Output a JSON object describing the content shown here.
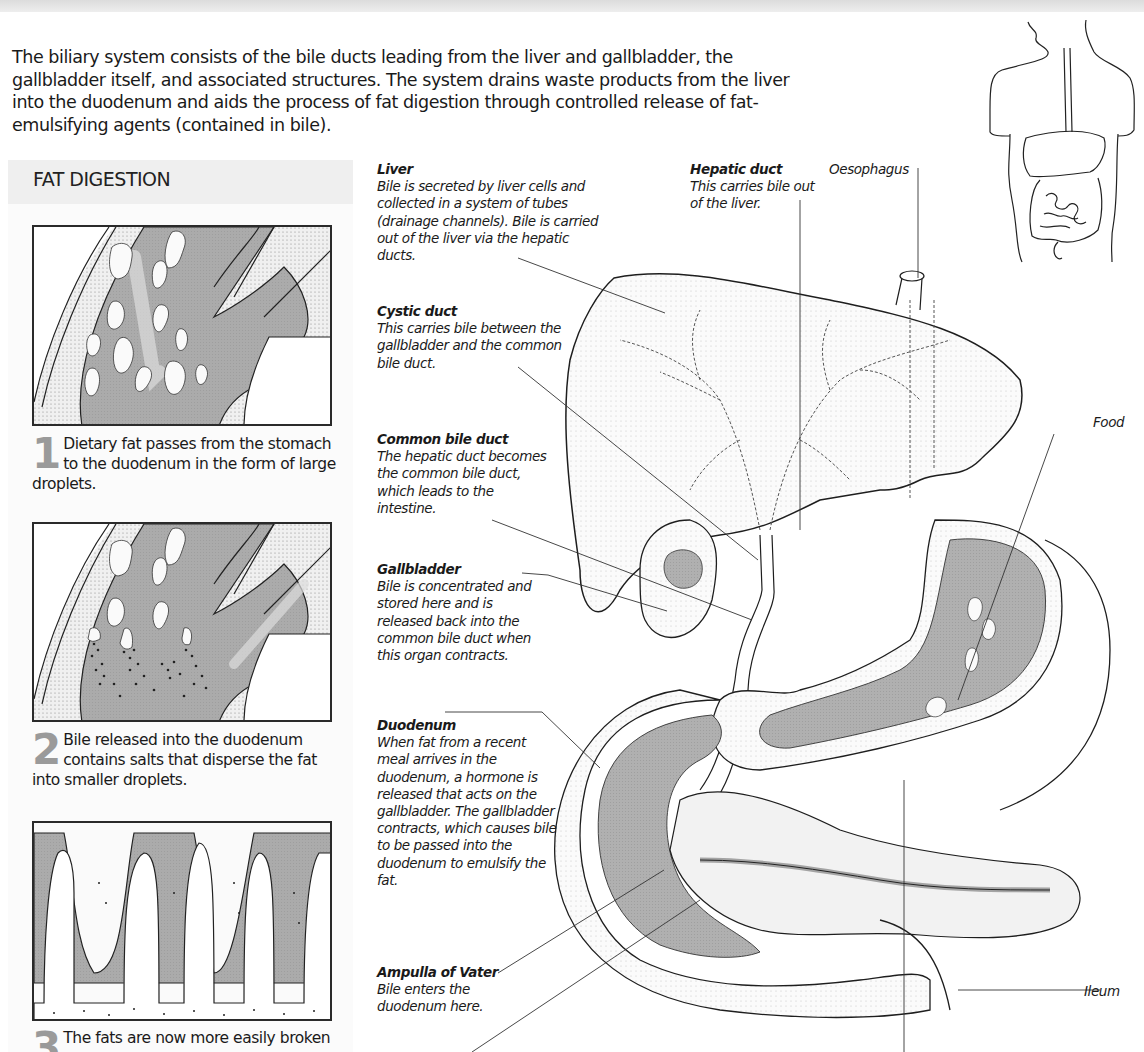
{
  "intro": {
    "text": "The biliary system consists of the bile ducts leading from the liver and gallbladder, the gallbladder itself, and associated structures. The system drains waste products from the liver into the duodenum and aids the process of fat digestion through controlled release of fat-emulsifying agents (contained in bile)."
  },
  "sidebar": {
    "title": "FAT DIGESTION",
    "steps": [
      {
        "number": "1",
        "text": "Dietary fat passes from the stomach to the duodenum in the form of large droplets."
      },
      {
        "number": "2",
        "text": "Bile released into the duodenum contains salts that disperse the fat into smaller droplets."
      },
      {
        "number": "3",
        "text": "The fats are now more easily broken"
      }
    ]
  },
  "labels": {
    "liver": {
      "title": "Liver",
      "desc": "Bile is secreted by liver cells and collected in a system of tubes (drainage channels). Bile is carried out of the liver via the hepatic ducts."
    },
    "cystic_duct": {
      "title": "Cystic duct",
      "desc": "This carries bile between the gallbladder and the common bile duct."
    },
    "common_bile_duct": {
      "title": "Common bile duct",
      "desc": "The hepatic duct becomes the common bile duct, which leads to the intestine."
    },
    "gallbladder": {
      "title": "Gallbladder",
      "desc": "Bile is concentrated and stored here and is released back into the common bile duct when this organ contracts."
    },
    "duodenum": {
      "title": "Duodenum",
      "desc": "When fat from a recent meal arrives in the duodenum, a hormone is released that acts on the gallbladder. The gallbladder contracts, which causes bile to be passed into the duodenum to emulsify the fat."
    },
    "ampulla": {
      "title": "Ampulla of Vater",
      "desc": "Bile enters the duodenum here."
    },
    "hepatic_duct": {
      "title": "Hepatic duct",
      "desc": "This carries bile out of the liver."
    },
    "oesophagus": {
      "title": "Oesophagus"
    },
    "food": {
      "title": "Food"
    },
    "ileum": {
      "title": "Ileum"
    }
  },
  "colors": {
    "tissue_gray": "#a8a8a8",
    "outline": "#1e1e1e",
    "number_gray": "#9a9a9a",
    "panel_bg": "#f7f7f7"
  }
}
